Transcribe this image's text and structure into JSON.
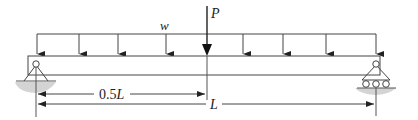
{
  "diagram": {
    "type": "simply-supported beam",
    "labels": {
      "distributed_load": "w",
      "point_load": "P",
      "half_span_num": "0.5",
      "half_span_var": "L",
      "span": "L"
    },
    "supports": {
      "left": "pin",
      "right": "roller"
    },
    "colors": {
      "line": "#333333",
      "ground": "#cfcfcf"
    }
  }
}
